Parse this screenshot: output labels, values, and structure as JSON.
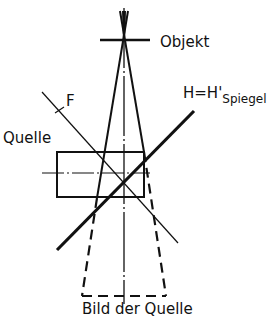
{
  "diagram": {
    "labels": {
      "object": "Objekt",
      "focus": "F",
      "mirror_main": "H=H'",
      "mirror_sub": "Spiegel",
      "source": "Quelle",
      "image": "Bild der Quelle"
    },
    "colors": {
      "ink": "#111111",
      "background": "#ffffff"
    },
    "elements": {
      "optical_axis": {
        "x": 124,
        "y1": 8,
        "y2": 304,
        "style": "dash-dot thin"
      },
      "object_bar": {
        "x1": 100,
        "x2": 150,
        "y": 40
      },
      "rays": [
        {
          "from": [
            124,
            10
          ],
          "to": [
            97,
            198
          ]
        },
        {
          "from": [
            124,
            10
          ],
          "to": [
            144,
            152
          ]
        },
        {
          "from": [
            120,
            10
          ],
          "to": [
            144,
            152
          ]
        },
        {
          "from": [
            128,
            10
          ],
          "to": [
            97,
            198
          ]
        }
      ],
      "source_rect": {
        "x1": 57,
        "y1": 152,
        "x2": 144,
        "y2": 197
      },
      "source_axis": {
        "y": 173,
        "x1": 42,
        "x2": 150
      },
      "mirror": {
        "from": [
          57,
          250
        ],
        "to": [
          194,
          111
        ]
      },
      "focal_line": {
        "from": [
          42,
          92
        ],
        "to": [
          178,
          243
        ]
      },
      "image_trapezoid": {
        "top_left": [
          97,
          198
        ],
        "top_right": [
          144,
          152
        ],
        "bottom_left": [
          82,
          296
        ],
        "bottom_right": [
          166,
          296
        ],
        "style": "dashed"
      }
    }
  }
}
